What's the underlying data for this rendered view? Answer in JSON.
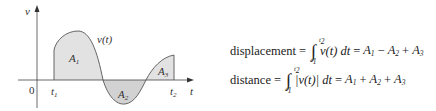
{
  "figure": {
    "axes": {
      "y_label": "v",
      "x_label": "t",
      "origin_label": "0",
      "t1_label": "t",
      "t1_sub": "1",
      "t2_label": "t",
      "t2_sub": "2"
    },
    "curve_label": "v(t)",
    "regions": [
      {
        "label": "A",
        "sub": "1",
        "sign": "positive"
      },
      {
        "label": "A",
        "sub": "2",
        "sign": "negative"
      },
      {
        "label": "A",
        "sub": "3",
        "sign": "positive"
      }
    ],
    "colors": {
      "fill": "#e2e2e2",
      "stroke": "#555555",
      "axis": "#444444"
    }
  },
  "formulas": {
    "displacement": {
      "word": "displacement",
      "eq": "=",
      "integral_upper": "t2",
      "integral_lower": "t1",
      "integrand": "v(t) dt",
      "eq2": "=",
      "terms": [
        {
          "label": "A",
          "sub": "1"
        },
        {
          "op": "−"
        },
        {
          "label": "A",
          "sub": "2"
        },
        {
          "op": "+"
        },
        {
          "label": "A",
          "sub": "3"
        }
      ]
    },
    "distance": {
      "word": "distance",
      "eq": "=",
      "integral_upper": "t2",
      "integral_lower": "t1",
      "integrand": "|v(t)| dt",
      "eq2": "=",
      "terms": [
        {
          "label": "A",
          "sub": "1"
        },
        {
          "op": "+"
        },
        {
          "label": "A",
          "sub": "2"
        },
        {
          "op": "+"
        },
        {
          "label": "A",
          "sub": "3"
        }
      ]
    }
  }
}
